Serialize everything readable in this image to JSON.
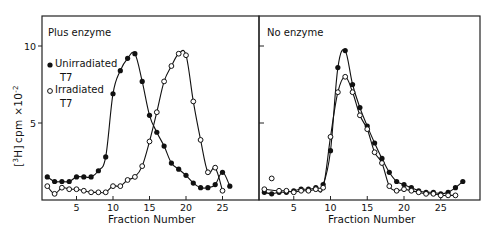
{
  "figure": {
    "ylabel": "[3H] cpm ×10⁻²",
    "xlabel": "Fraction Number"
  },
  "panels": [
    {
      "title": "Plus enzyme",
      "legend": [
        {
          "marker": "filled-circle",
          "label_line1": "Unirradiated",
          "label_line2": "T7"
        },
        {
          "marker": "open-circle",
          "label_line1": "Irradiated",
          "label_line2": "T7"
        }
      ],
      "xlabel": "Fraction Number"
    },
    {
      "title": "No enzyme",
      "xlabel": "Fraction Number"
    }
  ],
  "chart_data": [
    {
      "type": "line",
      "title": "Plus enzyme",
      "xlabel": "Fraction Number",
      "ylabel": "[3H] cpm ×10^-2",
      "xlim": [
        0,
        28.5
      ],
      "ylim": [
        0,
        12
      ],
      "xticks": [
        5,
        10,
        15,
        20,
        25
      ],
      "yticks": [
        5,
        10
      ],
      "grid": false,
      "legend_position": "upper-left",
      "series": [
        {
          "name": "Unirradiated T7",
          "marker": "filled-circle",
          "x": [
            1,
            2,
            3,
            4,
            5,
            6,
            7,
            8,
            9,
            10,
            11,
            12,
            13,
            14,
            15,
            16,
            17,
            18,
            19,
            20,
            21,
            22,
            23,
            24,
            25,
            26
          ],
          "y": [
            1.5,
            1.2,
            1.2,
            1.2,
            1.5,
            1.5,
            1.5,
            1.9,
            2.8,
            6.9,
            8.4,
            9.2,
            9.5,
            7.7,
            5.5,
            4.4,
            3.5,
            2.4,
            2.0,
            1.6,
            1.1,
            0.8,
            0.8,
            1.0,
            1.8,
            0.9
          ]
        },
        {
          "name": "Irradiated T7",
          "marker": "open-circle",
          "x": [
            1,
            2,
            3,
            4,
            5,
            6,
            7,
            8,
            9,
            10,
            11,
            12,
            13,
            14,
            15,
            16,
            17,
            18,
            19,
            20,
            21,
            22,
            23,
            24,
            25
          ],
          "y": [
            0.9,
            0.4,
            0.8,
            0.7,
            0.7,
            0.6,
            0.5,
            0.5,
            0.5,
            0.9,
            0.9,
            1.3,
            1.5,
            2.2,
            3.8,
            5.7,
            7.7,
            8.7,
            9.5,
            9.4,
            6.4,
            3.9,
            1.8,
            2.1,
            0.6
          ]
        }
      ]
    },
    {
      "type": "line",
      "title": "No enzyme",
      "xlabel": "Fraction Number",
      "ylabel": "[3H] cpm ×10^-2",
      "xlim": [
        0,
        30
      ],
      "ylim": [
        0,
        12
      ],
      "xticks": [
        5,
        10,
        15,
        20,
        25
      ],
      "yticks": [
        5,
        10
      ],
      "grid": false,
      "series": [
        {
          "name": "Unirradiated T7",
          "marker": "filled-circle",
          "x": [
            1,
            2,
            3,
            4,
            5,
            6,
            7,
            8,
            9,
            10,
            11,
            12,
            13,
            14,
            15,
            16,
            17,
            18,
            19,
            20,
            21,
            22,
            23,
            24,
            25,
            26,
            27,
            28
          ],
          "y": [
            0.5,
            0.4,
            0.5,
            0.5,
            0.6,
            0.7,
            0.7,
            0.8,
            1.0,
            3.2,
            8.6,
            9.7,
            7.5,
            6.0,
            4.8,
            3.7,
            2.7,
            1.8,
            1.2,
            1.0,
            0.8,
            0.6,
            0.5,
            0.5,
            0.4,
            0.5,
            0.8,
            1.2
          ]
        },
        {
          "name": "Irradiated T7",
          "marker": "open-circle",
          "x": [
            1,
            2,
            3,
            4,
            5,
            6,
            7,
            8,
            9,
            10,
            11,
            12,
            13,
            14,
            15,
            16,
            17,
            18,
            19,
            20,
            21,
            22,
            23,
            24,
            25,
            26,
            27
          ],
          "y": [
            0.7,
            1.4,
            0.6,
            0.6,
            0.5,
            0.6,
            0.6,
            0.7,
            0.8,
            4.1,
            7.0,
            8.0,
            7.0,
            5.5,
            4.6,
            3.1,
            2.4,
            0.9,
            0.6,
            0.7,
            0.6,
            0.5,
            0.4,
            0.4,
            0.3,
            0.3,
            0.3
          ]
        }
      ]
    }
  ]
}
